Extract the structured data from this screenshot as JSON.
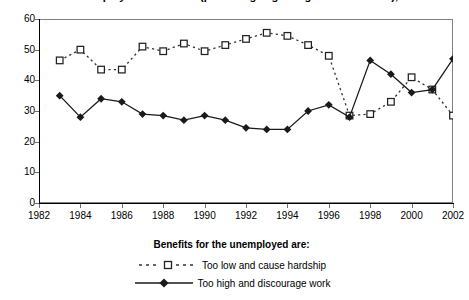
{
  "chart_data": {
    "type": "line",
    "title": "Attitudes to unemployment benefits (percentage agreeing with statement), 1983-2002",
    "xlabel": "",
    "ylabel": "",
    "xlim": [
      1982,
      2002
    ],
    "ylim": [
      0,
      60
    ],
    "ytick_step": 10,
    "xtick_step": 2,
    "grid": false,
    "legend_position": "bottom",
    "legend_title": "Benefits for the unemployed are:",
    "x": [
      1983,
      1984,
      1985,
      1986,
      1987,
      1988,
      1989,
      1990,
      1991,
      1992,
      1993,
      1994,
      1995,
      1996,
      1997,
      1998,
      1999,
      2000,
      2001,
      2002
    ],
    "xtick_labels": [
      "1982",
      "1984",
      "1986",
      "1988",
      "1990",
      "1992",
      "1994",
      "1996",
      "1998",
      "2000",
      "2002"
    ],
    "ytick_labels": [
      "0",
      "10",
      "20",
      "30",
      "40",
      "50",
      "60"
    ],
    "series": [
      {
        "name": "Too low and cause hardship",
        "marker": "open-square",
        "line_style": "dotted",
        "color": "#333333",
        "values": [
          46.5,
          50.0,
          43.5,
          43.5,
          51.0,
          49.5,
          52.0,
          49.5,
          51.5,
          53.5,
          55.5,
          54.5,
          51.5,
          48.0,
          28.5,
          29.0,
          33.0,
          41.0,
          37.0,
          28.5
        ]
      },
      {
        "name": "Too high and discourage work",
        "marker": "filled-diamond",
        "line_style": "solid",
        "color": "#1a1a1a",
        "values": [
          35.0,
          28.0,
          34.0,
          33.0,
          29.0,
          28.5,
          27.0,
          28.5,
          27.0,
          24.5,
          24.0,
          24.0,
          30.0,
          32.0,
          28.0,
          46.5,
          42.0,
          36.0,
          37.0,
          47.0
        ]
      }
    ]
  }
}
